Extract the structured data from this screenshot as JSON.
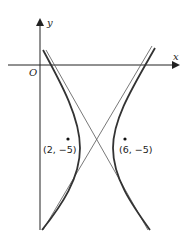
{
  "figure": {
    "type": "hyperbola-graph",
    "axes": {
      "x_label": "x",
      "y_label": "y",
      "origin_label": "O"
    },
    "points": [
      {
        "label": "(2, −5)",
        "x": 2,
        "y": -5
      },
      {
        "label": "(6, −5)",
        "x": 6,
        "y": -5
      }
    ],
    "center": {
      "x": 4,
      "y": -5
    },
    "curves": [
      "left-branch",
      "right-branch",
      "asymptote-1",
      "asymptote-2"
    ],
    "colors": {
      "curve": "#333333",
      "axis": "#222222",
      "asymptote": "#555555"
    }
  }
}
